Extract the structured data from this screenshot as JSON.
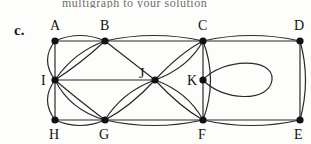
{
  "figure": {
    "part_label": "c.",
    "top_text_fragment": "multigraph to your solution",
    "type": "multigraph-diagram"
  },
  "graph": {
    "vertices": [
      {
        "id": "A",
        "label": "A",
        "x": 55,
        "y": 41,
        "lx": 50,
        "ly": 30
      },
      {
        "id": "B",
        "label": "B",
        "x": 105,
        "y": 41,
        "lx": 100,
        "ly": 30
      },
      {
        "id": "C",
        "label": "C",
        "x": 203,
        "y": 41,
        "lx": 198,
        "ly": 30
      },
      {
        "id": "D",
        "label": "D",
        "x": 300,
        "y": 41,
        "lx": 294,
        "ly": 30
      },
      {
        "id": "I",
        "label": "I",
        "x": 55,
        "y": 80,
        "lx": 41,
        "ly": 85
      },
      {
        "id": "J",
        "label": "J",
        "x": 155,
        "y": 80,
        "lx": 139,
        "ly": 78
      },
      {
        "id": "K",
        "label": "K",
        "x": 203,
        "y": 80,
        "lx": 187,
        "ly": 85
      },
      {
        "id": "H",
        "label": "H",
        "x": 55,
        "y": 120,
        "lx": 49,
        "ly": 139
      },
      {
        "id": "G",
        "label": "G",
        "x": 105,
        "y": 120,
        "lx": 99,
        "ly": 139
      },
      {
        "id": "F",
        "label": "F",
        "x": 203,
        "y": 120,
        "lx": 198,
        "ly": 139
      },
      {
        "id": "E",
        "label": "E",
        "x": 300,
        "y": 120,
        "lx": 294,
        "ly": 139
      }
    ],
    "edges": [
      {
        "from": "A",
        "to": "B",
        "multiplicity": 2,
        "shape": "straight+arc-up"
      },
      {
        "from": "B",
        "to": "C",
        "multiplicity": 2,
        "shape": "straight+arc-up"
      },
      {
        "from": "C",
        "to": "D",
        "multiplicity": 2,
        "shape": "straight+arc-up"
      },
      {
        "from": "H",
        "to": "G",
        "multiplicity": 2,
        "shape": "straight+arc-down"
      },
      {
        "from": "G",
        "to": "F",
        "multiplicity": 2,
        "shape": "straight+arc-down"
      },
      {
        "from": "F",
        "to": "E",
        "multiplicity": 2,
        "shape": "straight+arc-down"
      },
      {
        "from": "A",
        "to": "I",
        "multiplicity": 2,
        "shape": "straight+arc-left"
      },
      {
        "from": "I",
        "to": "H",
        "multiplicity": 2,
        "shape": "straight+arc-left"
      },
      {
        "from": "D",
        "to": "E",
        "multiplicity": 2,
        "shape": "straight+arc-right"
      },
      {
        "from": "B",
        "to": "I",
        "multiplicity": 2,
        "shape": "two-arcs"
      },
      {
        "from": "I",
        "to": "G",
        "multiplicity": 2,
        "shape": "two-arcs"
      },
      {
        "from": "I",
        "to": "J",
        "multiplicity": 1,
        "shape": "straight"
      },
      {
        "from": "B",
        "to": "J",
        "multiplicity": 1,
        "shape": "straight"
      },
      {
        "from": "J",
        "to": "G",
        "multiplicity": 2,
        "shape": "two-arcs"
      },
      {
        "from": "J",
        "to": "C",
        "multiplicity": 2,
        "shape": "two-arcs"
      },
      {
        "from": "J",
        "to": "F",
        "multiplicity": 2,
        "shape": "two-arcs"
      },
      {
        "from": "C",
        "to": "F",
        "multiplicity": 2,
        "shape": "straight-through-K+arc-right"
      },
      {
        "from": "K",
        "to": "K",
        "multiplicity": 1,
        "shape": "self-loop-right"
      }
    ],
    "style": {
      "vertex_radius": 3.6,
      "vertex_color": "#111111",
      "edge_color": "#2a2a2a",
      "edge_width": 1.2,
      "background": "#fdfdfb"
    }
  }
}
